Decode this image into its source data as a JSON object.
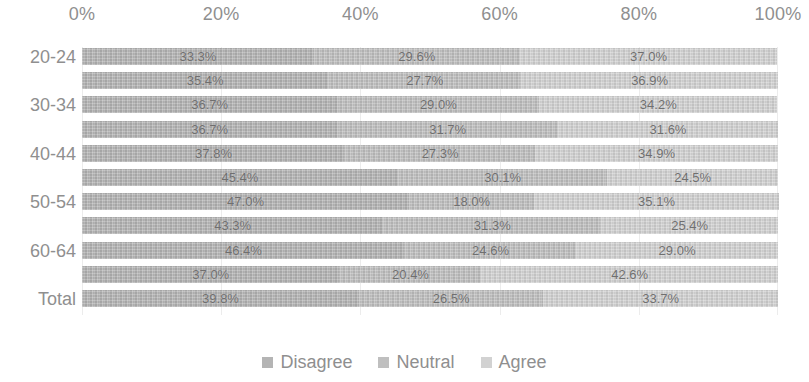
{
  "chart_data": {
    "type": "bar",
    "subtype": "100% stacked horizontal bar",
    "title": "",
    "xlabel": "",
    "ylabel": "",
    "xlim": [
      0,
      100
    ],
    "xticks": [
      "0%",
      "20%",
      "40%",
      "60%",
      "80%",
      "100%"
    ],
    "xtick_values": [
      0,
      20,
      40,
      60,
      80,
      100
    ],
    "grid": true,
    "legend_position": "bottom",
    "categories": [
      "20-24",
      "",
      "30-34",
      "",
      "40-44",
      "",
      "50-54",
      "",
      "60-64",
      "",
      "Total"
    ],
    "visible_category_labels": [
      "20-24",
      "30-34",
      "40-44",
      "50-54",
      "60-64",
      "Total"
    ],
    "series": [
      {
        "name": "Disagree",
        "color": "#b4b4b4",
        "values": [
          33.3,
          35.4,
          36.7,
          36.7,
          37.8,
          45.4,
          47.0,
          43.3,
          46.4,
          37.0,
          39.8
        ],
        "labels": [
          "33.3%",
          "35.4%",
          "36.7%",
          "36.7%",
          "37.8%",
          "45.4%",
          "47.0%",
          "43.3%",
          "46.4%",
          "37.0%",
          "39.8%"
        ]
      },
      {
        "name": "Neutral",
        "color": "#bfbfbf",
        "values": [
          29.6,
          27.7,
          29.0,
          31.7,
          27.3,
          30.1,
          18.0,
          31.3,
          24.6,
          20.4,
          26.5
        ],
        "labels": [
          "29.6%",
          "27.7%",
          "29.0%",
          "31.7%",
          "27.3%",
          "30.1%",
          "18.0%",
          "31.3%",
          "24.6%",
          "20.4%",
          "26.5%"
        ]
      },
      {
        "name": "Agree",
        "color": "#d2d2d2",
        "values": [
          37.0,
          36.9,
          34.2,
          31.6,
          34.9,
          24.5,
          35.1,
          25.4,
          29.0,
          42.6,
          33.7
        ],
        "labels": [
          "37.0%",
          "36.9%",
          "34.2%",
          "31.6%",
          "34.9%",
          "24.5%",
          "35.1%",
          "25.4%",
          "29.0%",
          "42.6%",
          "33.7%"
        ]
      }
    ]
  },
  "legend": {
    "items": [
      {
        "label": "Disagree",
        "color": "#b4b4b4",
        "swatch": "square-swatch"
      },
      {
        "label": "Neutral",
        "color": "#bfbfbf",
        "swatch": "square-swatch"
      },
      {
        "label": "Agree",
        "color": "#d2d2d2",
        "swatch": "square-swatch"
      }
    ]
  },
  "colors": {
    "background": "#ffffff",
    "text": "#8f8f8f",
    "data_label": "#6f6f6f",
    "gridline": "#ececec"
  }
}
